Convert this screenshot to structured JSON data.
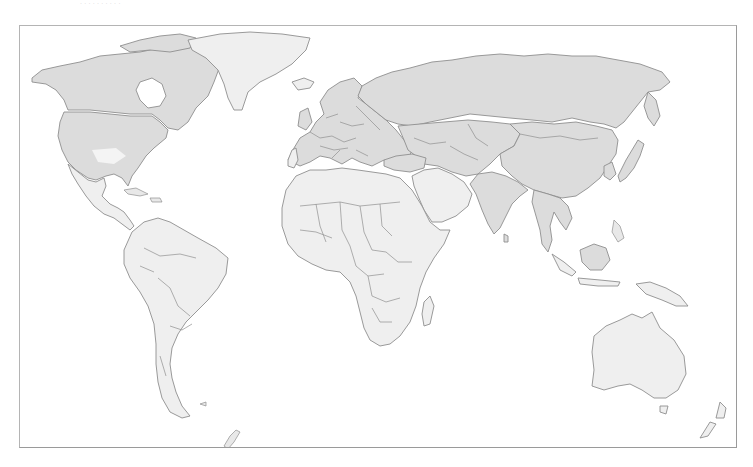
{
  "caption": "· · · ·  ·  ·  ·   ·  ·  ·",
  "map": {
    "type": "world-choropleth",
    "projection": "miller",
    "colors": {
      "higher_group": "#dcdcdc",
      "lower_group": "#efefef",
      "border": "#8f8f8f",
      "ocean": "#ffffff",
      "frame": "#b4b4b4"
    },
    "regions": [
      {
        "name": "Canada",
        "group": "higher"
      },
      {
        "name": "United States",
        "group": "higher"
      },
      {
        "name": "Alaska",
        "group": "higher"
      },
      {
        "name": "Mexico",
        "group": "lower"
      },
      {
        "name": "Central America",
        "group": "lower"
      },
      {
        "name": "Caribbean",
        "group": "lower"
      },
      {
        "name": "South America",
        "group": "lower"
      },
      {
        "name": "Greenland",
        "group": "lower"
      },
      {
        "name": "Iceland",
        "group": "lower"
      },
      {
        "name": "Europe",
        "group": "higher"
      },
      {
        "name": "Portugal",
        "group": "lower"
      },
      {
        "name": "Russia",
        "group": "higher"
      },
      {
        "name": "Central Asia",
        "group": "higher"
      },
      {
        "name": "Turkey",
        "group": "higher"
      },
      {
        "name": "Iran",
        "group": "higher"
      },
      {
        "name": "Afghanistan",
        "group": "higher"
      },
      {
        "name": "Pakistan",
        "group": "higher"
      },
      {
        "name": "India",
        "group": "higher"
      },
      {
        "name": "China",
        "group": "higher"
      },
      {
        "name": "Mongolia",
        "group": "higher"
      },
      {
        "name": "Japan",
        "group": "higher"
      },
      {
        "name": "Korea",
        "group": "higher"
      },
      {
        "name": "Southeast Asia mainland",
        "group": "higher"
      },
      {
        "name": "Borneo / Malaysia",
        "group": "higher"
      },
      {
        "name": "Arabian Peninsula",
        "group": "lower"
      },
      {
        "name": "Africa",
        "group": "lower"
      },
      {
        "name": "Indonesia",
        "group": "lower"
      },
      {
        "name": "Papua New Guinea",
        "group": "lower"
      },
      {
        "name": "Australia",
        "group": "lower"
      },
      {
        "name": "New Zealand",
        "group": "lower"
      },
      {
        "name": "Madagascar",
        "group": "lower"
      }
    ]
  }
}
